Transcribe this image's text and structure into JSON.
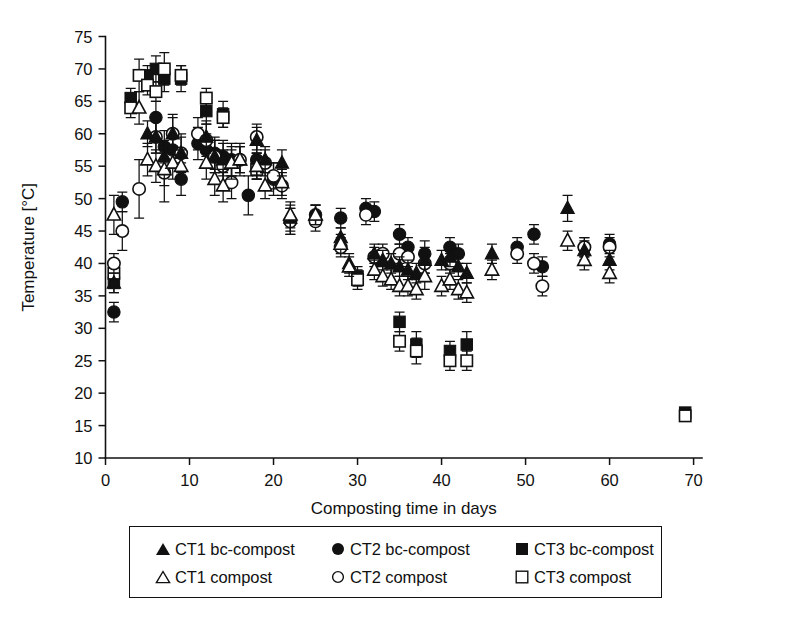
{
  "figure": {
    "title": "",
    "background": "#ffffff",
    "ink_color": "#111111"
  },
  "axes": {
    "y": {
      "label": "Temperature [°C]",
      "ticks": [
        10,
        15,
        20,
        25,
        30,
        35,
        40,
        45,
        50,
        55,
        60,
        65,
        70,
        75
      ],
      "min": 10,
      "max": 75
    },
    "x": {
      "label": "Composting time in days",
      "ticks": [
        0,
        10,
        20,
        30,
        40,
        50,
        60,
        70
      ],
      "min": 0,
      "max": 71
    }
  },
  "legend": {
    "rows": [
      [
        {
          "marker": "filled-triangle",
          "label": "CT1 bc-compost"
        },
        {
          "marker": "filled-circle",
          "label": "CT2 bc-compost"
        },
        {
          "marker": "filled-square",
          "label": "CT3 bc-compost"
        }
      ],
      [
        {
          "marker": "open-triangle",
          "label": "CT1 compost"
        },
        {
          "marker": "open-circle",
          "label": "CT2 compost"
        },
        {
          "marker": "open-square",
          "label": "CT3 compost"
        }
      ]
    ]
  },
  "chart_data": {
    "type": "scatter",
    "title": "",
    "xlabel": "Composting time in days",
    "ylabel": "Temperature [°C]",
    "xlim": [
      0,
      71
    ],
    "ylim": [
      10,
      75
    ],
    "grid": false,
    "legend_position": "below-axes",
    "error_bars": "vertical, standard deviation",
    "series": [
      {
        "name": "CT1 bc-compost",
        "marker": "filled-triangle",
        "color": "#111111",
        "points": [
          {
            "x": 1,
            "y": 37.0,
            "err": 1.5
          },
          {
            "x": 5,
            "y": 60.0,
            "err": 2.0
          },
          {
            "x": 6,
            "y": 59.5,
            "err": 2.5
          },
          {
            "x": 7,
            "y": 56.5,
            "err": 2.5
          },
          {
            "x": 8,
            "y": 60.0,
            "err": 2.5
          },
          {
            "x": 9,
            "y": 57.0,
            "err": 2.5
          },
          {
            "x": 12,
            "y": 59.5,
            "err": 2.5
          },
          {
            "x": 13,
            "y": 56.5,
            "err": 2.5
          },
          {
            "x": 14,
            "y": 56.0,
            "err": 2.5
          },
          {
            "x": 15,
            "y": 55.5,
            "err": 2.5
          },
          {
            "x": 16,
            "y": 56.0,
            "err": 2.0
          },
          {
            "x": 18,
            "y": 59.0,
            "err": 2.0
          },
          {
            "x": 19,
            "y": 56.0,
            "err": 2.0
          },
          {
            "x": 21,
            "y": 55.5,
            "err": 2.0
          },
          {
            "x": 22,
            "y": 47.0,
            "err": 2.0
          },
          {
            "x": 25,
            "y": 47.5,
            "err": 1.5
          },
          {
            "x": 28,
            "y": 44.0,
            "err": 1.5
          },
          {
            "x": 29,
            "y": 40.0,
            "err": 1.5
          },
          {
            "x": 32,
            "y": 41.5,
            "err": 1.5
          },
          {
            "x": 33,
            "y": 40.5,
            "err": 1.5
          },
          {
            "x": 34,
            "y": 40.0,
            "err": 1.5
          },
          {
            "x": 35,
            "y": 39.5,
            "err": 1.5
          },
          {
            "x": 36,
            "y": 39.0,
            "err": 1.5
          },
          {
            "x": 37,
            "y": 38.5,
            "err": 1.5
          },
          {
            "x": 38,
            "y": 40.5,
            "err": 2.0
          },
          {
            "x": 40,
            "y": 40.5,
            "err": 1.5
          },
          {
            "x": 41,
            "y": 41.0,
            "err": 1.5
          },
          {
            "x": 42,
            "y": 39.5,
            "err": 1.5
          },
          {
            "x": 43,
            "y": 38.5,
            "err": 1.5
          },
          {
            "x": 46,
            "y": 41.5,
            "err": 1.5
          },
          {
            "x": 55,
            "y": 48.5,
            "err": 2.0
          },
          {
            "x": 57,
            "y": 42.0,
            "err": 1.5
          },
          {
            "x": 60,
            "y": 40.5,
            "err": 1.5
          }
        ]
      },
      {
        "name": "CT1 compost",
        "marker": "open-triangle",
        "color": "#111111",
        "points": [
          {
            "x": 1,
            "y": 47.5,
            "err": 3.0
          },
          {
            "x": 4,
            "y": 64.0,
            "err": 2.5
          },
          {
            "x": 5,
            "y": 56.0,
            "err": 2.5
          },
          {
            "x": 6,
            "y": 55.0,
            "err": 2.5
          },
          {
            "x": 7,
            "y": 54.5,
            "err": 2.5
          },
          {
            "x": 8,
            "y": 55.5,
            "err": 2.5
          },
          {
            "x": 9,
            "y": 55.0,
            "err": 2.5
          },
          {
            "x": 12,
            "y": 55.5,
            "err": 2.5
          },
          {
            "x": 13,
            "y": 53.0,
            "err": 2.5
          },
          {
            "x": 14,
            "y": 52.0,
            "err": 2.5
          },
          {
            "x": 15,
            "y": 55.5,
            "err": 2.0
          },
          {
            "x": 16,
            "y": 56.0,
            "err": 2.0
          },
          {
            "x": 18,
            "y": 55.0,
            "err": 2.0
          },
          {
            "x": 19,
            "y": 52.0,
            "err": 2.0
          },
          {
            "x": 21,
            "y": 52.5,
            "err": 2.0
          },
          {
            "x": 22,
            "y": 47.5,
            "err": 2.0
          },
          {
            "x": 25,
            "y": 47.5,
            "err": 1.5
          },
          {
            "x": 28,
            "y": 43.0,
            "err": 1.5
          },
          {
            "x": 29,
            "y": 39.5,
            "err": 1.5
          },
          {
            "x": 32,
            "y": 39.0,
            "err": 1.5
          },
          {
            "x": 33,
            "y": 38.0,
            "err": 1.5
          },
          {
            "x": 34,
            "y": 37.5,
            "err": 1.5
          },
          {
            "x": 35,
            "y": 36.5,
            "err": 1.5
          },
          {
            "x": 36,
            "y": 36.5,
            "err": 1.5
          },
          {
            "x": 37,
            "y": 36.0,
            "err": 1.5
          },
          {
            "x": 38,
            "y": 38.0,
            "err": 2.0
          },
          {
            "x": 40,
            "y": 36.5,
            "err": 1.5
          },
          {
            "x": 41,
            "y": 37.5,
            "err": 1.5
          },
          {
            "x": 42,
            "y": 36.0,
            "err": 1.5
          },
          {
            "x": 43,
            "y": 35.5,
            "err": 1.5
          },
          {
            "x": 46,
            "y": 39.0,
            "err": 1.5
          },
          {
            "x": 55,
            "y": 43.5,
            "err": 1.5
          },
          {
            "x": 57,
            "y": 40.5,
            "err": 1.5
          },
          {
            "x": 60,
            "y": 38.5,
            "err": 1.5
          }
        ]
      },
      {
        "name": "CT2 bc-compost",
        "marker": "filled-circle",
        "color": "#111111",
        "points": [
          {
            "x": 1,
            "y": 32.5,
            "err": 1.5
          },
          {
            "x": 2,
            "y": 49.5,
            "err": 1.5
          },
          {
            "x": 6,
            "y": 62.5,
            "err": 2.5
          },
          {
            "x": 7,
            "y": 58.0,
            "err": 2.5
          },
          {
            "x": 8,
            "y": 57.5,
            "err": 2.5
          },
          {
            "x": 9,
            "y": 53.0,
            "err": 2.5
          },
          {
            "x": 11,
            "y": 58.5,
            "err": 2.5
          },
          {
            "x": 12,
            "y": 57.5,
            "err": 2.5
          },
          {
            "x": 13,
            "y": 57.0,
            "err": 2.5
          },
          {
            "x": 14,
            "y": 56.5,
            "err": 2.5
          },
          {
            "x": 15,
            "y": 56.0,
            "err": 2.5
          },
          {
            "x": 17,
            "y": 50.5,
            "err": 3.0
          },
          {
            "x": 18,
            "y": 56.0,
            "err": 2.5
          },
          {
            "x": 20,
            "y": 53.0,
            "err": 2.5
          },
          {
            "x": 22,
            "y": 46.5,
            "err": 2.0
          },
          {
            "x": 25,
            "y": 47.5,
            "err": 1.5
          },
          {
            "x": 28,
            "y": 47.0,
            "err": 1.5
          },
          {
            "x": 31,
            "y": 48.5,
            "err": 1.5
          },
          {
            "x": 32,
            "y": 48.0,
            "err": 1.5
          },
          {
            "x": 35,
            "y": 44.5,
            "err": 1.5
          },
          {
            "x": 36,
            "y": 42.5,
            "err": 1.5
          },
          {
            "x": 38,
            "y": 41.5,
            "err": 2.0
          },
          {
            "x": 41,
            "y": 42.5,
            "err": 1.5
          },
          {
            "x": 42,
            "y": 41.5,
            "err": 1.5
          },
          {
            "x": 49,
            "y": 42.5,
            "err": 1.5
          },
          {
            "x": 51,
            "y": 44.5,
            "err": 1.5
          },
          {
            "x": 52,
            "y": 39.5,
            "err": 1.5
          },
          {
            "x": 57,
            "y": 42.5,
            "err": 1.5
          },
          {
            "x": 60,
            "y": 43.0,
            "err": 1.5
          }
        ]
      },
      {
        "name": "CT2 compost",
        "marker": "open-circle",
        "color": "#111111",
        "points": [
          {
            "x": 1,
            "y": 40.0,
            "err": 1.5
          },
          {
            "x": 2,
            "y": 45.0,
            "err": 3.0
          },
          {
            "x": 4,
            "y": 51.5,
            "err": 4.5
          },
          {
            "x": 6,
            "y": 59.5,
            "err": 2.5
          },
          {
            "x": 7,
            "y": 54.0,
            "err": 4.5
          },
          {
            "x": 8,
            "y": 60.0,
            "err": 3.0
          },
          {
            "x": 9,
            "y": 57.0,
            "err": 3.0
          },
          {
            "x": 11,
            "y": 60.0,
            "err": 2.5
          },
          {
            "x": 12,
            "y": 59.0,
            "err": 2.5
          },
          {
            "x": 13,
            "y": 56.5,
            "err": 2.5
          },
          {
            "x": 14,
            "y": 55.0,
            "err": 2.5
          },
          {
            "x": 15,
            "y": 52.5,
            "err": 2.5
          },
          {
            "x": 16,
            "y": 56.0,
            "err": 2.5
          },
          {
            "x": 18,
            "y": 59.5,
            "err": 2.0
          },
          {
            "x": 19,
            "y": 55.5,
            "err": 2.0
          },
          {
            "x": 20,
            "y": 53.5,
            "err": 2.0
          },
          {
            "x": 21,
            "y": 52.0,
            "err": 2.0
          },
          {
            "x": 22,
            "y": 46.5,
            "err": 2.0
          },
          {
            "x": 25,
            "y": 46.5,
            "err": 1.5
          },
          {
            "x": 28,
            "y": 42.5,
            "err": 1.5
          },
          {
            "x": 31,
            "y": 47.5,
            "err": 1.5
          },
          {
            "x": 32,
            "y": 41.0,
            "err": 1.5
          },
          {
            "x": 33,
            "y": 41.5,
            "err": 1.5
          },
          {
            "x": 35,
            "y": 41.5,
            "err": 1.5
          },
          {
            "x": 36,
            "y": 41.0,
            "err": 1.5
          },
          {
            "x": 38,
            "y": 40.0,
            "err": 1.5
          },
          {
            "x": 41,
            "y": 40.0,
            "err": 1.5
          },
          {
            "x": 49,
            "y": 41.5,
            "err": 1.5
          },
          {
            "x": 51,
            "y": 40.0,
            "err": 1.5
          },
          {
            "x": 52,
            "y": 36.5,
            "err": 1.5
          },
          {
            "x": 57,
            "y": 42.5,
            "err": 1.5
          },
          {
            "x": 60,
            "y": 42.5,
            "err": 1.5
          }
        ]
      },
      {
        "name": "CT3 bc-compost",
        "marker": "filled-square",
        "color": "#111111",
        "points": [
          {
            "x": 1,
            "y": 37.0,
            "err": 1.5
          },
          {
            "x": 3,
            "y": 65.5,
            "err": 1.5
          },
          {
            "x": 5,
            "y": 69.0,
            "err": 1.5
          },
          {
            "x": 6,
            "y": 70.0,
            "err": 2.0
          },
          {
            "x": 7,
            "y": 68.5,
            "err": 2.0
          },
          {
            "x": 9,
            "y": 68.5,
            "err": 2.0
          },
          {
            "x": 12,
            "y": 63.5,
            "err": 2.0
          },
          {
            "x": 14,
            "y": 63.0,
            "err": 2.0
          },
          {
            "x": 18,
            "y": 55.0,
            "err": 2.0
          },
          {
            "x": 30,
            "y": 38.0,
            "err": 1.5
          },
          {
            "x": 35,
            "y": 31.0,
            "err": 1.5
          },
          {
            "x": 37,
            "y": 27.5,
            "err": 2.0
          },
          {
            "x": 41,
            "y": 26.5,
            "err": 1.5
          },
          {
            "x": 43,
            "y": 27.5,
            "err": 2.0
          },
          {
            "x": 69,
            "y": 17.0,
            "err": 0
          }
        ]
      },
      {
        "name": "CT3 compost",
        "marker": "open-square",
        "color": "#111111",
        "points": [
          {
            "x": 1,
            "y": 38.5,
            "err": 1.5
          },
          {
            "x": 3,
            "y": 64.0,
            "err": 1.5
          },
          {
            "x": 4,
            "y": 69.0,
            "err": 2.5
          },
          {
            "x": 5,
            "y": 67.5,
            "err": 1.5
          },
          {
            "x": 6,
            "y": 66.5,
            "err": 1.5
          },
          {
            "x": 7,
            "y": 70.0,
            "err": 2.5
          },
          {
            "x": 9,
            "y": 69.0,
            "err": 1.5
          },
          {
            "x": 12,
            "y": 65.5,
            "err": 1.5
          },
          {
            "x": 14,
            "y": 62.5,
            "err": 1.5
          },
          {
            "x": 18,
            "y": 54.5,
            "err": 1.5
          },
          {
            "x": 30,
            "y": 37.5,
            "err": 1.5
          },
          {
            "x": 35,
            "y": 28.0,
            "err": 1.5
          },
          {
            "x": 37,
            "y": 26.5,
            "err": 2.0
          },
          {
            "x": 41,
            "y": 25.0,
            "err": 1.5
          },
          {
            "x": 43,
            "y": 25.0,
            "err": 1.5
          },
          {
            "x": 69,
            "y": 16.5,
            "err": 0
          }
        ]
      }
    ]
  }
}
